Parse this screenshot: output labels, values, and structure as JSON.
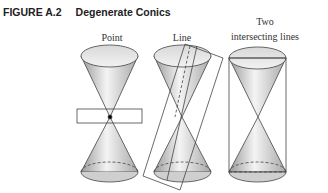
{
  "figure": {
    "number": "FIGURE A.2",
    "title": "Degenerate Conics"
  },
  "panels": [
    {
      "label": "Point"
    },
    {
      "label": "Line"
    },
    {
      "label_line1": "Two",
      "label_line2": "intersecting lines"
    }
  ]
}
